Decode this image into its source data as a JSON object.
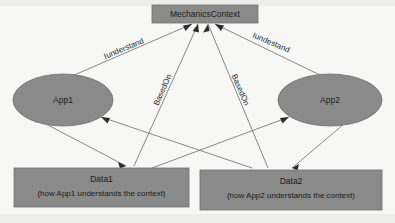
{
  "diagram": {
    "colors": {
      "node_fill": "#8a8a8a",
      "node_stroke": "#6f6f6f",
      "edge_stroke": "#7b7b7b",
      "arrow_fill": "#2b2b2b",
      "background": "#f7f7f5",
      "text": "#1c1c1c"
    },
    "nodes": {
      "context": {
        "label": "MechanicsContext",
        "shape": "rectangle"
      },
      "app1": {
        "label": "App1",
        "shape": "ellipse"
      },
      "app2": {
        "label": "App2",
        "shape": "ellipse"
      },
      "data1": {
        "label": "Data1",
        "sublabel": "(how App1 understands the context)",
        "shape": "rectangle"
      },
      "data2": {
        "label": "Data2",
        "sublabel": "(how App2 understands the context)",
        "shape": "rectangle"
      }
    },
    "edges": {
      "app1_to_context": {
        "label": "Iunderstand",
        "from": "App1",
        "to": "MechanicsContext"
      },
      "app2_to_context": {
        "label": "Iundestand",
        "from": "App2",
        "to": "MechanicsContext"
      },
      "data1_to_context": {
        "label": "BasedOn",
        "from": "Data1",
        "to": "MechanicsContext"
      },
      "data2_to_context": {
        "label": "BasedOn",
        "from": "Data2",
        "to": "MechanicsContext"
      },
      "app1_data1": {
        "label": "",
        "from": "App1",
        "to": "Data1"
      },
      "app1_data2": {
        "label": "",
        "from": "App1",
        "to": "Data2"
      },
      "app2_data1": {
        "label": "",
        "from": "App2",
        "to": "Data1"
      },
      "app2_data2": {
        "label": "",
        "from": "App2",
        "to": "Data2"
      }
    }
  }
}
